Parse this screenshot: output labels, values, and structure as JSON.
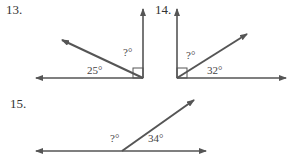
{
  "problems": [
    {
      "number": "13.",
      "known_angle": "25°",
      "unknown_angle": "?°"
    },
    {
      "number": "14.",
      "known_angle": "32°",
      "unknown_angle": "?°"
    },
    {
      "number": "15.",
      "known_angle": "34°",
      "unknown_angle": "?°"
    }
  ]
}
